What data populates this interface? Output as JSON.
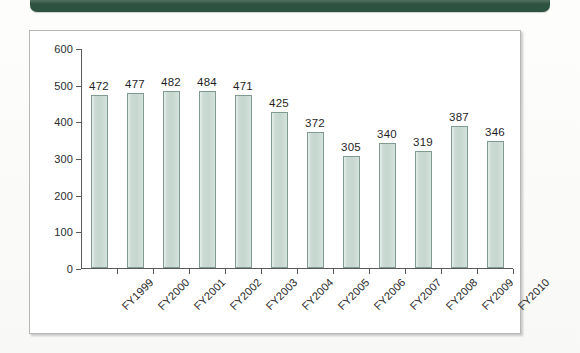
{
  "banner": {
    "color": "#2e5240",
    "label": ""
  },
  "panel": {
    "border_color": "#b6b8b8",
    "background": "#ffffff"
  },
  "chart_data": {
    "type": "bar",
    "title": "",
    "xlabel": "",
    "ylabel": "",
    "categories": [
      "FY1999",
      "FY2000",
      "FY2001",
      "FY2002",
      "FY2003",
      "FY2004",
      "FY2005",
      "FY2006",
      "FY2007",
      "FY2008",
      "FY2009",
      "FY2010"
    ],
    "values": [
      472,
      477,
      482,
      484,
      471,
      425,
      372,
      305,
      340,
      319,
      387,
      346
    ],
    "ylim": [
      0,
      600
    ],
    "ytick_step": 100,
    "yticks": [
      0,
      100,
      200,
      300,
      400,
      500,
      600
    ],
    "ytick_labels": [
      "0",
      "100",
      "200",
      "300",
      "400",
      "500",
      "600"
    ],
    "grid": false,
    "legend": null,
    "data_labels": true,
    "bar_fill": "#c5d7cf",
    "bar_stroke": "#7f9b92",
    "axis_color": "#595959",
    "xtick_label_rotation": -45
  }
}
